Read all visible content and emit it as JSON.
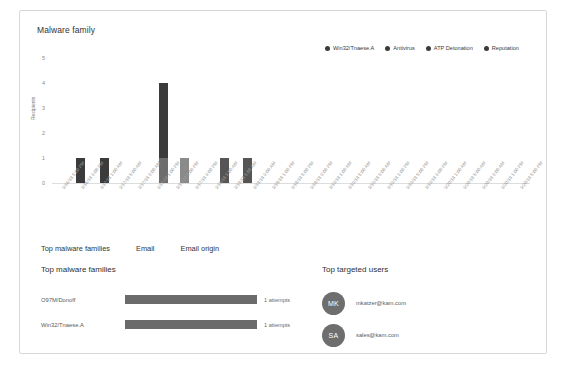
{
  "chart_card": {
    "title": "Malware family"
  },
  "chart_data": {
    "type": "bar",
    "title": "Malware family",
    "xlabel": "",
    "ylabel": "Recipients",
    "ylim": [
      0,
      5
    ],
    "yticks": [
      0,
      1,
      2,
      3,
      4,
      5
    ],
    "grid": false,
    "legend_position": "top-right",
    "stacked": true,
    "categories": [
      "9/16/18 5:00 PM",
      "9/16/18 9:00 PM",
      "9/17/18 1:00 AM",
      "9/17/18 5:00 AM",
      "9/17/18 9:00 AM",
      "9/17/18 1:00 PM",
      "9/17/18 5:00 PM",
      "9/17/18 9:00 PM",
      "9/18/18 1:00 AM",
      "9/18/18 5:00 AM",
      "9/18/18 9:00 AM",
      "9/18/18 1:00 PM",
      "9/18/18 5:00 PM",
      "9/18/18 9:00 PM",
      "9/19/18 1:00 AM",
      "9/19/18 5:00 AM",
      "9/19/18 9:00 AM",
      "9/19/18 1:00 PM",
      "9/19/18 5:00 PM",
      "9/19/18 9:00 PM",
      "9/20/18 1:00 AM",
      "9/20/18 5:00 AM",
      "9/20/18 9:00 AM",
      "9/20/18 1:00 PM",
      "9/20/18 5:00 PM"
    ],
    "series": [
      {
        "name": "Win32/Tnaese.A",
        "color": "#3b3b3b",
        "values": [
          1,
          1,
          0,
          0,
          0,
          0,
          3,
          0,
          0,
          1,
          1,
          0,
          0,
          0,
          0,
          0,
          0,
          0,
          0,
          0,
          0,
          0,
          0,
          0,
          0
        ]
      },
      {
        "name": "Antivirus",
        "color": "#585858",
        "values": [
          0,
          0,
          0,
          0,
          0,
          0,
          1,
          0,
          0,
          0,
          0,
          0,
          0,
          0,
          0,
          0,
          0,
          0,
          0,
          0,
          0,
          0,
          0,
          0,
          0
        ]
      },
      {
        "name": "ATP Detonation",
        "color": "#7a7a7a",
        "values": [
          0,
          0,
          0,
          0,
          0,
          0,
          0,
          1,
          0,
          0,
          0,
          0,
          0,
          0,
          0,
          0,
          0,
          0,
          0,
          0,
          0,
          0,
          0,
          0,
          0
        ]
      },
      {
        "name": "Reputation",
        "color": "#9a9a9a",
        "values": [
          0,
          0,
          0,
          0,
          0,
          0,
          0,
          0,
          0,
          0,
          0,
          0,
          0,
          0,
          0,
          0,
          0,
          0,
          0,
          0,
          0,
          0,
          0,
          0,
          0
        ]
      }
    ],
    "legend": [
      {
        "label": "Win32/Tnaese.A",
        "color": "#3b3b3b"
      },
      {
        "label": "Antivirus",
        "color": "#3b3b3b"
      },
      {
        "label": "ATP Detonation",
        "color": "#3b3b3b"
      },
      {
        "label": "Reputation",
        "color": "#3b3b3b"
      }
    ],
    "bars": [
      {
        "x_index": 1,
        "left_pct": 5.0,
        "segments": [
          {
            "value": 1,
            "color": "#3b3b3b"
          }
        ]
      },
      {
        "x_index": 2,
        "left_pct": 10.1,
        "segments": [
          {
            "value": 1,
            "color": "#3b3b3b"
          }
        ]
      },
      {
        "x_index": 7,
        "left_pct": 22.4,
        "segments": [
          {
            "value": 1,
            "color": "#6d6d6d"
          },
          {
            "value": 3,
            "color": "#3b3b3b"
          }
        ]
      },
      {
        "x_index": 8,
        "left_pct": 26.8,
        "segments": [
          {
            "value": 1,
            "color": "#8a8a8a"
          }
        ]
      },
      {
        "x_index": 10,
        "left_pct": 35.2,
        "segments": [
          {
            "value": 1,
            "color": "#555555"
          }
        ]
      },
      {
        "x_index": 11,
        "left_pct": 40.0,
        "segments": [
          {
            "value": 1,
            "color": "#555555"
          }
        ]
      }
    ]
  },
  "tabs": [
    {
      "label": "Top malware families"
    },
    {
      "label": "Email"
    },
    {
      "label": "Email origin"
    }
  ],
  "top_malware_families": {
    "heading": "Top malware families",
    "rows": [
      {
        "name": "O97M/Donoff",
        "count": "1 attempts",
        "bar_pct": 100
      },
      {
        "name": "Win32/Tnaese.A",
        "count": "1 attempts",
        "bar_pct": 100
      }
    ]
  },
  "top_targeted_users": {
    "heading": "Top targeted users",
    "rows": [
      {
        "initials": "MK",
        "email": "mkatzer@kam.com"
      },
      {
        "initials": "SA",
        "email": "sales@kam.com"
      }
    ]
  },
  "colors": {
    "bar_dark": "#3b3b3b",
    "bar_mid": "#6d6d6d",
    "bar_light": "#8a8a8a",
    "avatar": "#6e6e6e",
    "panel_border": "#d8d8d8"
  }
}
